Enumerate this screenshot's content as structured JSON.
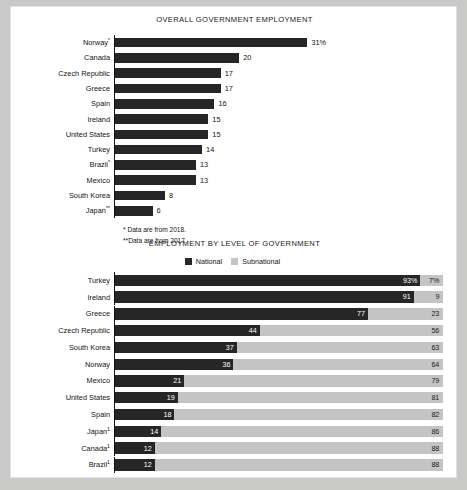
{
  "chart_data": [
    {
      "type": "bar",
      "title": "OVERALL GOVERNMENT EMPLOYMENT",
      "xlabel": "",
      "ylabel": "",
      "xlim": [
        0,
        31
      ],
      "grid": false,
      "legend": "none",
      "unit": "%",
      "categories": [
        "Norway*",
        "Canada",
        "Czech Republic",
        "Greece",
        "Spain",
        "Ireland",
        "United States",
        "Turkey",
        "Brazil*",
        "Mexico",
        "South Korea",
        "Japan**"
      ],
      "values": [
        31,
        20,
        17,
        17,
        16,
        15,
        15,
        14,
        13,
        13,
        8,
        6
      ],
      "value_labels": [
        "31%",
        "20",
        "17",
        "17",
        "16",
        "15",
        "15",
        "14",
        "13",
        "13",
        "8",
        "6"
      ],
      "footnotes": [
        "* Data are from 2018.",
        "**Data are from 2017."
      ]
    },
    {
      "type": "bar",
      "subtype": "stacked-100",
      "title": "EMPLOYMENT BY LEVEL OF GOVERNMENT",
      "xlabel": "",
      "ylabel": "",
      "xlim": [
        0,
        100
      ],
      "grid": false,
      "legend_position": "top-center",
      "legend": [
        "National",
        "Subnational"
      ],
      "categories": [
        "Turkey",
        "Ireland",
        "Greece",
        "Czech Republic",
        "South Korea",
        "Norway",
        "Mexico",
        "United States",
        "Spain",
        "Japan",
        "Canada",
        "Brazil"
      ],
      "category_marks": [
        "",
        "",
        "",
        "",
        "",
        "",
        "",
        "",
        "",
        "1",
        "1",
        "1"
      ],
      "series": [
        {
          "name": "National",
          "values": [
            93,
            91,
            77,
            44,
            37,
            36,
            21,
            19,
            18,
            14,
            12,
            12
          ],
          "labels": [
            "93%",
            "91",
            "77",
            "44",
            "37",
            "36",
            "21",
            "19",
            "18",
            "14",
            "12",
            "12"
          ]
        },
        {
          "name": "Subnational",
          "values": [
            7,
            9,
            23,
            56,
            63,
            64,
            79,
            81,
            82,
            86,
            88,
            88
          ],
          "labels": [
            "7%",
            "9",
            "23",
            "56",
            "63",
            "64",
            "79",
            "81",
            "82",
            "86",
            "88",
            "88"
          ]
        }
      ],
      "footnotes": [
        "¹Data are from 2014."
      ]
    }
  ],
  "colors": {
    "national": "#262626",
    "subnational": "#c4c4c4",
    "page_background": "#ffffff",
    "outer_background": "#c9c9c7",
    "text": "#141414"
  }
}
